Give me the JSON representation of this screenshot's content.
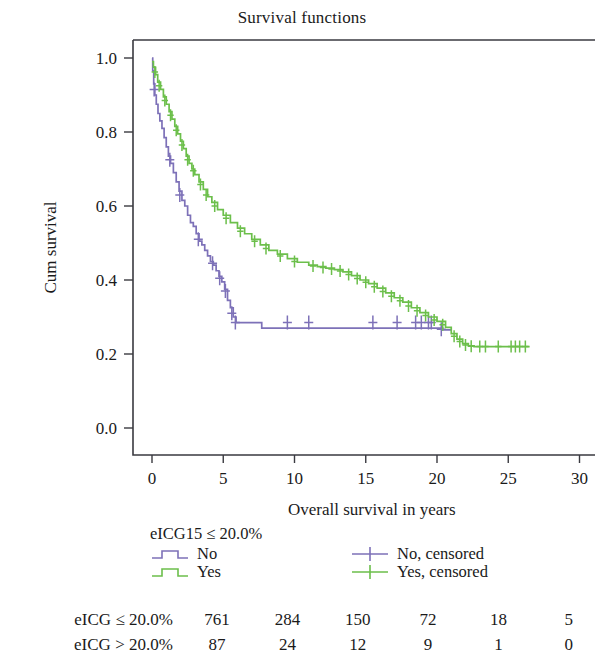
{
  "chart_data": {
    "type": "line",
    "subtype": "kaplan-meier-survival",
    "title": "Survival functions",
    "xlabel": "Overall survival in years",
    "ylabel": "Cum survival",
    "xlim": [
      0,
      30
    ],
    "ylim": [
      0.0,
      1.0
    ],
    "xticks": [
      "0",
      "5",
      "10",
      "15",
      "20",
      "25",
      "30"
    ],
    "yticks": [
      "0.0",
      "0.2",
      "0.4",
      "0.6",
      "0.8",
      "1.0"
    ],
    "grid": false,
    "legend_position": "below-axes",
    "colors": {
      "no": "#7D71B8",
      "yes": "#6CBF4B",
      "axis": "#3a3a40"
    },
    "series": [
      {
        "name": "No",
        "group": "eICG15 > 20.0%",
        "color": "#7D71B8",
        "points": [
          [
            0.0,
            1.0
          ],
          [
            0.05,
            0.965
          ],
          [
            0.12,
            0.93
          ],
          [
            0.2,
            0.9
          ],
          [
            0.3,
            0.875
          ],
          [
            0.42,
            0.85
          ],
          [
            0.55,
            0.83
          ],
          [
            0.7,
            0.81
          ],
          [
            0.85,
            0.785
          ],
          [
            1.0,
            0.76
          ],
          [
            1.15,
            0.735
          ],
          [
            1.3,
            0.715
          ],
          [
            1.5,
            0.69
          ],
          [
            1.7,
            0.665
          ],
          [
            1.9,
            0.64
          ],
          [
            2.1,
            0.615
          ],
          [
            2.3,
            0.6
          ],
          [
            2.5,
            0.575
          ],
          [
            2.7,
            0.555
          ],
          [
            2.9,
            0.545
          ],
          [
            3.1,
            0.525
          ],
          [
            3.3,
            0.505
          ],
          [
            3.5,
            0.495
          ],
          [
            3.7,
            0.48
          ],
          [
            3.9,
            0.465
          ],
          [
            4.1,
            0.45
          ],
          [
            4.3,
            0.44
          ],
          [
            4.5,
            0.425
          ],
          [
            4.7,
            0.41
          ],
          [
            4.9,
            0.395
          ],
          [
            5.1,
            0.375
          ],
          [
            5.3,
            0.345
          ],
          [
            5.5,
            0.325
          ],
          [
            5.7,
            0.3
          ],
          [
            5.9,
            0.285
          ],
          [
            6.1,
            0.285
          ],
          [
            7.6,
            0.285
          ],
          [
            7.7,
            0.27
          ],
          [
            20.2,
            0.27
          ],
          [
            20.4,
            0.265
          ],
          [
            21.0,
            0.265
          ]
        ],
        "censored": [
          [
            0.15,
            0.915
          ],
          [
            1.25,
            0.725
          ],
          [
            1.95,
            0.63
          ],
          [
            3.25,
            0.51
          ],
          [
            4.25,
            0.445
          ],
          [
            4.75,
            0.405
          ],
          [
            5.15,
            0.37
          ],
          [
            5.6,
            0.31
          ],
          [
            5.85,
            0.285
          ],
          [
            9.5,
            0.285
          ],
          [
            11.0,
            0.285
          ],
          [
            15.5,
            0.285
          ],
          [
            17.2,
            0.285
          ],
          [
            18.5,
            0.285
          ],
          [
            18.9,
            0.285
          ],
          [
            19.4,
            0.285
          ],
          [
            19.6,
            0.285
          ],
          [
            20.3,
            0.267
          ]
        ]
      },
      {
        "name": "Yes",
        "group": "eICG15 ≤ 20.0%",
        "color": "#6CBF4B",
        "points": [
          [
            0.0,
            0.99
          ],
          [
            0.1,
            0.975
          ],
          [
            0.25,
            0.955
          ],
          [
            0.4,
            0.935
          ],
          [
            0.6,
            0.915
          ],
          [
            0.8,
            0.895
          ],
          [
            1.0,
            0.875
          ],
          [
            1.2,
            0.855
          ],
          [
            1.4,
            0.835
          ],
          [
            1.6,
            0.815
          ],
          [
            1.8,
            0.795
          ],
          [
            2.0,
            0.775
          ],
          [
            2.2,
            0.755
          ],
          [
            2.4,
            0.735
          ],
          [
            2.6,
            0.715
          ],
          [
            2.8,
            0.7
          ],
          [
            3.0,
            0.685
          ],
          [
            3.3,
            0.665
          ],
          [
            3.6,
            0.645
          ],
          [
            3.9,
            0.625
          ],
          [
            4.2,
            0.61
          ],
          [
            4.6,
            0.59
          ],
          [
            5.0,
            0.575
          ],
          [
            5.5,
            0.555
          ],
          [
            6.0,
            0.54
          ],
          [
            6.5,
            0.525
          ],
          [
            7.0,
            0.51
          ],
          [
            7.6,
            0.495
          ],
          [
            8.2,
            0.48
          ],
          [
            8.8,
            0.47
          ],
          [
            9.5,
            0.458
          ],
          [
            10.2,
            0.448
          ],
          [
            11.0,
            0.44
          ],
          [
            11.6,
            0.436
          ],
          [
            12.2,
            0.432
          ],
          [
            12.8,
            0.428
          ],
          [
            13.4,
            0.422
          ],
          [
            14.0,
            0.412
          ],
          [
            14.6,
            0.4
          ],
          [
            15.2,
            0.39
          ],
          [
            15.8,
            0.378
          ],
          [
            16.4,
            0.365
          ],
          [
            17.0,
            0.352
          ],
          [
            17.6,
            0.34
          ],
          [
            18.2,
            0.325
          ],
          [
            18.8,
            0.312
          ],
          [
            19.4,
            0.3
          ],
          [
            20.0,
            0.288
          ],
          [
            20.6,
            0.272
          ],
          [
            21.0,
            0.255
          ],
          [
            21.4,
            0.24
          ],
          [
            21.8,
            0.228
          ],
          [
            22.2,
            0.222
          ],
          [
            22.6,
            0.22
          ],
          [
            26.5,
            0.22
          ]
        ],
        "censored": [
          [
            0.2,
            0.962
          ],
          [
            0.5,
            0.925
          ],
          [
            0.9,
            0.885
          ],
          [
            1.3,
            0.845
          ],
          [
            1.7,
            0.805
          ],
          [
            2.1,
            0.765
          ],
          [
            2.5,
            0.725
          ],
          [
            2.9,
            0.695
          ],
          [
            3.4,
            0.658
          ],
          [
            3.8,
            0.63
          ],
          [
            4.4,
            0.6
          ],
          [
            5.2,
            0.567
          ],
          [
            6.2,
            0.532
          ],
          [
            7.2,
            0.505
          ],
          [
            8.0,
            0.485
          ],
          [
            9.0,
            0.465
          ],
          [
            10.0,
            0.45
          ],
          [
            11.3,
            0.438
          ],
          [
            12.0,
            0.434
          ],
          [
            12.6,
            0.43
          ],
          [
            13.2,
            0.424
          ],
          [
            13.8,
            0.415
          ],
          [
            14.4,
            0.404
          ],
          [
            15.0,
            0.394
          ],
          [
            15.6,
            0.382
          ],
          [
            16.2,
            0.369
          ],
          [
            16.8,
            0.356
          ],
          [
            17.4,
            0.344
          ],
          [
            18.0,
            0.33
          ],
          [
            18.6,
            0.317
          ],
          [
            19.2,
            0.304
          ],
          [
            19.8,
            0.292
          ],
          [
            20.4,
            0.279
          ],
          [
            21.2,
            0.248
          ],
          [
            21.6,
            0.234
          ],
          [
            22.0,
            0.224
          ],
          [
            22.4,
            0.221
          ],
          [
            23.0,
            0.22
          ],
          [
            23.4,
            0.22
          ],
          [
            24.3,
            0.22
          ],
          [
            25.2,
            0.22
          ],
          [
            25.5,
            0.22
          ],
          [
            25.8,
            0.22
          ],
          [
            26.2,
            0.22
          ]
        ]
      }
    ]
  },
  "legend": {
    "title": "eICG15 ≤ 20.0%",
    "entries": [
      {
        "label": "No",
        "icon": "step-line-icon",
        "color": "#7D71B8"
      },
      {
        "label": "Yes",
        "icon": "step-line-icon",
        "color": "#6CBF4B"
      },
      {
        "label": "No, censored",
        "icon": "plus-marker-icon",
        "color": "#7D71B8"
      },
      {
        "label": "Yes, censored",
        "icon": "plus-marker-icon",
        "color": "#6CBF4B"
      }
    ]
  },
  "risk_table": {
    "rows": [
      {
        "label": "eICG ≤ 20.0%",
        "values": [
          "761",
          "284",
          "150",
          "72",
          "18",
          "5"
        ]
      },
      {
        "label": "eICG > 20.0%",
        "values": [
          "87",
          "24",
          "12",
          "9",
          "1",
          "0"
        ]
      }
    ]
  }
}
